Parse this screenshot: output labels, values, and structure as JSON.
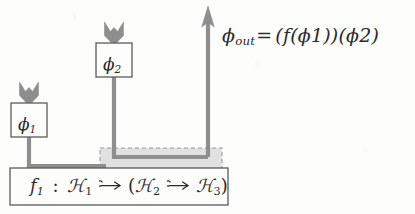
{
  "figure": {
    "kind": "string-diagram",
    "colors": {
      "wire": "#8c8c8c",
      "box_stroke": "#5f5f5f",
      "dashed_region_stroke": "#9a9a9a",
      "dashed_region_fill": "#d9d9d9",
      "text": "#2b2b2b",
      "background": "#fdfdfb"
    }
  },
  "nodes": {
    "phi1_box": {
      "label_base": "ϕ",
      "label_sub": "1",
      "label_full": "ϕ1",
      "x": 11,
      "y": 103,
      "w": 36,
      "h": 34
    },
    "phi2_box": {
      "label_base": "ϕ",
      "label_sub": "2",
      "label_full": "ϕ2",
      "x": 96,
      "y": 43,
      "w": 36,
      "h": 34
    },
    "f1_box": {
      "name": "f1-signature-box",
      "x": 10,
      "y": 168,
      "w": 218,
      "h": 37,
      "signature": {
        "fname": "f",
        "fname_sub": "1",
        "colon": ":",
        "dom": "ℋ",
        "dom_sub": "1",
        "arrow1": "partial-function-arrow",
        "open_paren": "(",
        "mid": "ℋ",
        "mid_sub": "2",
        "arrow2": "partial-function-arrow",
        "cod": "ℋ",
        "cod_sub": "3",
        "close_paren": ")",
        "plain_text": "f1 : ℋ1 ⇸ (ℋ2 ⇸ ℋ3)"
      }
    },
    "dashed_region": {
      "name": "highlighted-subregion",
      "x": 100,
      "y": 148,
      "w": 122,
      "h": 28
    }
  },
  "annotations": {
    "output_equation": {
      "lhs_base": "ϕ",
      "lhs_sub": "out",
      "eq": "=",
      "rhs": "(f(ϕ1))(ϕ2)",
      "plain_text": "ϕout = (f(ϕ1))(ϕ2)"
    }
  },
  "wires": [
    {
      "name": "phi1-input-wire",
      "desc": "arrowhead feeding into phi1 box from above"
    },
    {
      "name": "phi1-output-wire",
      "desc": "from phi1 box down, right, into f1 box"
    },
    {
      "name": "phi2-input-wire",
      "desc": "arrowhead feeding into phi2 box from above"
    },
    {
      "name": "phi2-output-wire",
      "desc": "from phi2 box down into dashed region, right"
    },
    {
      "name": "output-wire",
      "desc": "vertical wire leaving to the top with arrowhead, labeled phi-out"
    }
  ]
}
